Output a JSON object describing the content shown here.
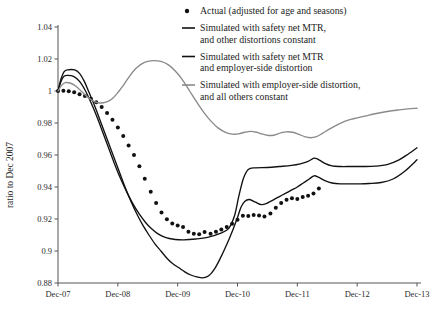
{
  "chart_data": {
    "type": "line",
    "title": "",
    "xlabel": "",
    "ylabel": "ratio to Dec 2007",
    "xlim": [
      "Dec-07",
      "Dec-13"
    ],
    "ylim": [
      0.88,
      1.04
    ],
    "grid": false,
    "legend_position": "top-right",
    "y_ticks": [
      "1.04",
      "1.02",
      "1",
      "0.98",
      "0.96",
      "0.94",
      "0.92",
      "0.9",
      "0.88"
    ],
    "y_tick_values": [
      1.04,
      1.02,
      1.0,
      0.98,
      0.96,
      0.94,
      0.92,
      0.9,
      0.88
    ],
    "x_ticks": [
      "Dec-07",
      "Dec-08",
      "Dec-09",
      "Dec-10",
      "Dec-11",
      "Dec-12",
      "Dec-13"
    ],
    "x_tick_values": [
      0,
      1,
      2,
      3,
      4,
      5,
      6
    ],
    "legend": [
      {
        "label_lines": [
          "Actual (adjusted for age and seasons)"
        ],
        "marker": "dot",
        "color": "#111111"
      },
      {
        "label_lines": [
          "Simulated with safety net MTR,",
          "and other distortions constant"
        ],
        "marker": "line",
        "color": "#111111"
      },
      {
        "label_lines": [
          "Simulated with safety net MTR",
          "and employer-side distortion"
        ],
        "marker": "line",
        "color": "#111111"
      },
      {
        "label_lines": [
          "Simulated with employer-side distortion,",
          "and all others constant"
        ],
        "marker": "line",
        "color": "#8a8a8a"
      }
    ],
    "series": [
      {
        "name": "Actual (adjusted for age and seasons)",
        "marker": "dot",
        "color": "#111111",
        "points": [
          [
            0.0,
            1.0
          ],
          [
            0.09,
            1.0002
          ],
          [
            0.18,
            0.9998
          ],
          [
            0.27,
            0.9992
          ],
          [
            0.36,
            0.998
          ],
          [
            0.45,
            0.9968
          ],
          [
            0.55,
            0.9952
          ],
          [
            0.64,
            0.993
          ],
          [
            0.73,
            0.99
          ],
          [
            0.82,
            0.9862
          ],
          [
            0.91,
            0.982
          ],
          [
            1.0,
            0.9772
          ],
          [
            1.09,
            0.9718
          ],
          [
            1.18,
            0.966
          ],
          [
            1.27,
            0.96
          ],
          [
            1.36,
            0.953
          ],
          [
            1.45,
            0.9452
          ],
          [
            1.55,
            0.937
          ],
          [
            1.64,
            0.93
          ],
          [
            1.73,
            0.924
          ],
          [
            1.82,
            0.9198
          ],
          [
            1.91,
            0.9172
          ],
          [
            2.0,
            0.916
          ],
          [
            2.09,
            0.915
          ],
          [
            2.18,
            0.912
          ],
          [
            2.27,
            0.9108
          ],
          [
            2.36,
            0.9105
          ],
          [
            2.45,
            0.9118
          ],
          [
            2.55,
            0.9108
          ],
          [
            2.64,
            0.912
          ],
          [
            2.73,
            0.9135
          ],
          [
            2.82,
            0.915
          ],
          [
            2.91,
            0.917
          ],
          [
            3.0,
            0.9195
          ],
          [
            3.09,
            0.922
          ],
          [
            3.18,
            0.9218
          ],
          [
            3.27,
            0.9225
          ],
          [
            3.36,
            0.9222
          ],
          [
            3.45,
            0.9215
          ],
          [
            3.55,
            0.9235
          ],
          [
            3.64,
            0.927
          ],
          [
            3.73,
            0.93
          ],
          [
            3.82,
            0.932
          ],
          [
            3.91,
            0.933
          ],
          [
            4.0,
            0.9325
          ],
          [
            4.09,
            0.9338
          ],
          [
            4.18,
            0.9345
          ],
          [
            4.27,
            0.936
          ],
          [
            4.36,
            0.939
          ]
        ]
      },
      {
        "name": "Simulated with safety net MTR, and other distortions constant",
        "marker": "line",
        "color": "#111111",
        "points": [
          [
            0.0,
            1.0
          ],
          [
            0.05,
            1.0075
          ],
          [
            0.1,
            1.012
          ],
          [
            0.16,
            1.0132
          ],
          [
            0.28,
            1.0132
          ],
          [
            0.36,
            1.011
          ],
          [
            0.44,
            1.006
          ],
          [
            0.52,
            0.999
          ],
          [
            0.62,
            0.99
          ],
          [
            0.72,
            0.98
          ],
          [
            0.82,
            0.97
          ],
          [
            0.92,
            0.96
          ],
          [
            1.02,
            0.95
          ],
          [
            1.12,
            0.94
          ],
          [
            1.22,
            0.931
          ],
          [
            1.32,
            0.923
          ],
          [
            1.42,
            0.916
          ],
          [
            1.52,
            0.91
          ],
          [
            1.62,
            0.9045
          ],
          [
            1.72,
            0.9
          ],
          [
            1.82,
            0.8955
          ],
          [
            1.92,
            0.892
          ],
          [
            2.02,
            0.8895
          ],
          [
            2.12,
            0.887
          ],
          [
            2.22,
            0.885
          ],
          [
            2.32,
            0.8838
          ],
          [
            2.42,
            0.8832
          ],
          [
            2.52,
            0.8845
          ],
          [
            2.62,
            0.889
          ],
          [
            2.72,
            0.896
          ],
          [
            2.82,
            0.904
          ],
          [
            2.92,
            0.913
          ],
          [
            3.0,
            0.921
          ],
          [
            3.06,
            0.9275
          ],
          [
            3.12,
            0.931
          ],
          [
            3.2,
            0.9322
          ],
          [
            3.3,
            0.9305
          ],
          [
            3.4,
            0.929
          ],
          [
            3.5,
            0.93
          ],
          [
            3.6,
            0.932
          ],
          [
            3.7,
            0.934
          ],
          [
            3.8,
            0.936
          ],
          [
            3.9,
            0.938
          ],
          [
            4.0,
            0.94
          ],
          [
            4.1,
            0.9425
          ],
          [
            4.2,
            0.945
          ],
          [
            4.28,
            0.947
          ],
          [
            4.36,
            0.946
          ],
          [
            4.46,
            0.944
          ],
          [
            4.58,
            0.9425
          ],
          [
            4.72,
            0.942
          ],
          [
            4.9,
            0.942
          ],
          [
            5.05,
            0.942
          ],
          [
            5.2,
            0.9422
          ],
          [
            5.4,
            0.9428
          ],
          [
            5.6,
            0.945
          ],
          [
            5.8,
            0.95
          ],
          [
            6.0,
            0.957
          ]
        ]
      },
      {
        "name": "Simulated with safety net MTR and employer-side distortion",
        "marker": "line",
        "color": "#111111",
        "points": [
          [
            0.0,
            1.0
          ],
          [
            0.05,
            1.006
          ],
          [
            0.1,
            1.0092
          ],
          [
            0.16,
            1.0098
          ],
          [
            0.26,
            1.0092
          ],
          [
            0.36,
            1.006
          ],
          [
            0.46,
            1.0
          ],
          [
            0.56,
            0.992
          ],
          [
            0.66,
            0.983
          ],
          [
            0.76,
            0.973
          ],
          [
            0.86,
            0.963
          ],
          [
            0.96,
            0.953
          ],
          [
            1.06,
            0.944
          ],
          [
            1.16,
            0.936
          ],
          [
            1.26,
            0.929
          ],
          [
            1.36,
            0.923
          ],
          [
            1.46,
            0.918
          ],
          [
            1.56,
            0.914
          ],
          [
            1.66,
            0.911
          ],
          [
            1.76,
            0.909
          ],
          [
            1.86,
            0.9078
          ],
          [
            1.96,
            0.9072
          ],
          [
            2.1,
            0.907
          ],
          [
            2.3,
            0.9075
          ],
          [
            2.5,
            0.9085
          ],
          [
            2.7,
            0.9108
          ],
          [
            2.85,
            0.914
          ],
          [
            2.95,
            0.922
          ],
          [
            3.02,
            0.934
          ],
          [
            3.1,
            0.9455
          ],
          [
            3.18,
            0.951
          ],
          [
            3.3,
            0.952
          ],
          [
            3.5,
            0.9522
          ],
          [
            3.7,
            0.9528
          ],
          [
            3.9,
            0.9535
          ],
          [
            4.05,
            0.9545
          ],
          [
            4.18,
            0.956
          ],
          [
            4.28,
            0.958
          ],
          [
            4.36,
            0.957
          ],
          [
            4.46,
            0.9548
          ],
          [
            4.58,
            0.9532
          ],
          [
            4.72,
            0.9528
          ],
          [
            4.9,
            0.9528
          ],
          [
            5.1,
            0.9528
          ],
          [
            5.3,
            0.953
          ],
          [
            5.5,
            0.954
          ],
          [
            5.7,
            0.957
          ],
          [
            5.85,
            0.9605
          ],
          [
            6.0,
            0.9645
          ]
        ]
      },
      {
        "name": "Simulated with employer-side distortion, and all others constant",
        "marker": "line",
        "color": "#8a8a8a",
        "points": [
          [
            0.0,
            1.0
          ],
          [
            0.06,
            1.0035
          ],
          [
            0.12,
            1.0052
          ],
          [
            0.2,
            1.005
          ],
          [
            0.3,
            1.003
          ],
          [
            0.4,
            0.9995
          ],
          [
            0.5,
            0.996
          ],
          [
            0.6,
            0.9935
          ],
          [
            0.7,
            0.9925
          ],
          [
            0.8,
            0.993
          ],
          [
            0.9,
            0.995
          ],
          [
            1.0,
            0.999
          ],
          [
            1.1,
            1.004
          ],
          [
            1.2,
            1.0095
          ],
          [
            1.3,
            1.014
          ],
          [
            1.4,
            1.017
          ],
          [
            1.5,
            1.0185
          ],
          [
            1.6,
            1.019
          ],
          [
            1.72,
            1.0185
          ],
          [
            1.84,
            1.0165
          ],
          [
            1.96,
            1.0125
          ],
          [
            2.08,
            1.007
          ],
          [
            2.2,
            1.0
          ],
          [
            2.32,
            0.993
          ],
          [
            2.44,
            0.9865
          ],
          [
            2.56,
            0.981
          ],
          [
            2.68,
            0.9768
          ],
          [
            2.8,
            0.9742
          ],
          [
            2.92,
            0.973
          ],
          [
            3.02,
            0.9732
          ],
          [
            3.12,
            0.9742
          ],
          [
            3.22,
            0.9748
          ],
          [
            3.32,
            0.9742
          ],
          [
            3.42,
            0.973
          ],
          [
            3.52,
            0.9722
          ],
          [
            3.62,
            0.9725
          ],
          [
            3.72,
            0.9738
          ],
          [
            3.82,
            0.9745
          ],
          [
            3.92,
            0.9742
          ],
          [
            4.02,
            0.973
          ],
          [
            4.12,
            0.9715
          ],
          [
            4.22,
            0.9708
          ],
          [
            4.32,
            0.9715
          ],
          [
            4.42,
            0.9735
          ],
          [
            4.55,
            0.9765
          ],
          [
            4.7,
            0.9795
          ],
          [
            4.85,
            0.9818
          ],
          [
            5.0,
            0.9832
          ],
          [
            5.15,
            0.9845
          ],
          [
            5.3,
            0.9858
          ],
          [
            5.5,
            0.9872
          ],
          [
            5.7,
            0.9882
          ],
          [
            5.85,
            0.9888
          ],
          [
            6.0,
            0.9892
          ]
        ]
      }
    ]
  }
}
